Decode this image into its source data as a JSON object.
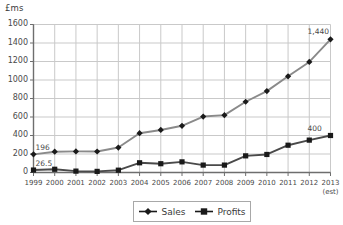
{
  "chart_data": {
    "type": "line",
    "title": "",
    "xlabel": "",
    "ylabel": "£ms",
    "ylim": [
      0,
      1600
    ],
    "ytick_step": 200,
    "yticks": [
      1600,
      1400,
      1200,
      1000,
      800,
      600,
      400,
      200,
      0
    ],
    "grid": true,
    "legend_position": "bottom-center",
    "categories": [
      "1999",
      "2000",
      "2001",
      "2002",
      "2003",
      "2004",
      "2005",
      "2006",
      "2007",
      "2008",
      "2009",
      "2010",
      "2011",
      "2012",
      "2013"
    ],
    "x_sublabels": [
      "",
      "",
      "",
      "",
      "",
      "",
      "",
      "",
      "",
      "",
      "",
      "",
      "",
      "",
      "(est)"
    ],
    "series": [
      {
        "name": "Sales",
        "marker": "diamond",
        "color": "#1a1a1a",
        "line_color": "#8a8a8a",
        "values": [
          196,
          225,
          228,
          227,
          270,
          425,
          460,
          505,
          605,
          620,
          765,
          880,
          1040,
          1195,
          1440
        ]
      },
      {
        "name": "Profits",
        "marker": "square",
        "color": "#1a1a1a",
        "line_color": "#4a4a4a",
        "values": [
          26.5,
          35,
          15,
          12,
          25,
          105,
          95,
          115,
          80,
          80,
          180,
          195,
          295,
          350,
          400
        ]
      }
    ],
    "annotations": [
      {
        "text": "196",
        "series": "Sales",
        "index": 0,
        "position": "above-right"
      },
      {
        "text": "26.5",
        "series": "Profits",
        "index": 0,
        "position": "above-right"
      },
      {
        "text": "1,440",
        "series": "Sales",
        "index": 14,
        "position": "above-left"
      },
      {
        "text": "400",
        "series": "Profits",
        "index": 14,
        "position": "above-left"
      }
    ]
  },
  "legend": {
    "entries": [
      {
        "label": "Sales",
        "marker": "diamond"
      },
      {
        "label": "Profits",
        "marker": "square"
      }
    ]
  },
  "colors": {
    "grid": "#c9c9c9",
    "axis": "#6e6e6e",
    "sales_line": "#8a8a8a",
    "profits_line": "#4a4a4a",
    "marker": "#1a1a1a",
    "text": "#3a3a3a"
  }
}
